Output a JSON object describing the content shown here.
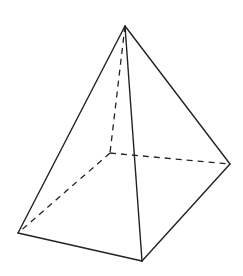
{
  "diagram": {
    "type": "square-pyramid",
    "colors": {
      "stroke": "#222222",
      "background": "#ffffff"
    },
    "vertices": {
      "apex": [
        125,
        26
      ],
      "hidden": [
        110,
        153
      ],
      "right": [
        230,
        164
      ],
      "front": [
        142,
        261
      ],
      "left": [
        18,
        233
      ]
    },
    "solid_edges": [
      [
        "apex",
        "left"
      ],
      [
        "apex",
        "front"
      ],
      [
        "apex",
        "right"
      ],
      [
        "left",
        "front"
      ],
      [
        "front",
        "right"
      ]
    ],
    "dashed_edges": [
      [
        "apex",
        "hidden"
      ],
      [
        "hidden",
        "left"
      ],
      [
        "hidden",
        "right"
      ]
    ]
  }
}
